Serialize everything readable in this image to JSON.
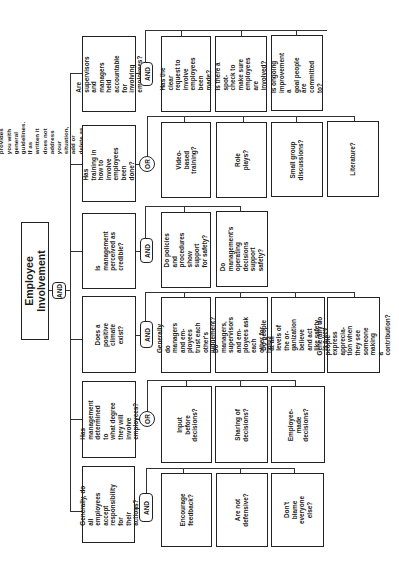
{
  "note": "This Fault tree provides you with\ngeneral guidelines. If as written it\ndoes not address your situation,\nadd or delete as needed.",
  "root": {
    "label": "Employee\nInvolvement",
    "gate": "AND"
  },
  "branches": [
    {
      "question": "Are supervisors\nand managers\nheld accountable\nfor involving\nemployees?",
      "gate": "AND",
      "children": [
        "Has the clear\nrequest to involve\nemployees been\nmade?",
        "Is there a\nspot-check to\nmake sure\nemployees are\ninvolved?",
        "Is ongoing\nimprovement a\ngoal people are\ncommitted to?"
      ]
    },
    {
      "question": "Has training in\nhow to involve\nemployees been\ndone?",
      "gate": "OR",
      "children": [
        "Video-based\ntraining?",
        "Role plays?",
        "Small group\ndiscussions?",
        "Literature?"
      ]
    },
    {
      "question": "Is management\nperceived as\ncredible?",
      "gate": "AND",
      "children": [
        "Do policies\nand procedures\nshow support\nfor safety?",
        "Do management's\noperating\ndecisions\nsupport safety?"
      ]
    },
    {
      "question": "Does a positive\nclimate exist?",
      "gate": "AND",
      "children": [
        "Generally do\nmanagers and em-\nployees trust each\nother's judgement?",
        "Do managers,\nsupervisors and em-\nployees ask each\nother for help?",
        "Do people at all\nlevels of the or-\nganization believe\nand act like safety\nis a key value?",
        "Generally do people\nexpress apprecia-\ntion when they see\nsomeone making\na contribution?"
      ]
    },
    {
      "question": "Has management\ndetermined to\nwhat degree\nthey will involve\nemployees?",
      "gate": "OR",
      "children": [
        "Input before\ndecisions?",
        "Sharing of\ndecisions?",
        "Employee-made\ndecisions?"
      ]
    },
    {
      "question": "Generally, do all\nemployees accept\nresponsibility for\ntheir actions?",
      "gate": "AND",
      "children": [
        "Encourage\nfeedback?",
        "Are not\ndefensive?",
        "Don't blame\neveryone else?"
      ]
    }
  ]
}
